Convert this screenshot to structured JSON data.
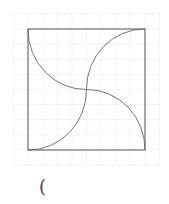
{
  "figure": {
    "grid_cells": 10,
    "square_cells": 8,
    "arcs": [
      {
        "name": "top-left-arc",
        "from": "top-left-corner",
        "to": "center"
      },
      {
        "name": "top-right-arc",
        "from": "center",
        "to": "top-right-corner"
      },
      {
        "name": "bottom-right-arc",
        "from": "center",
        "to": "bottom-right-corner"
      },
      {
        "name": "bottom-left-arc",
        "from": "center",
        "to": "bottom-left-corner"
      }
    ],
    "colors": {
      "line": "#555555",
      "grid": "#dcdcdc"
    }
  },
  "caption": {
    "text": "("
  }
}
